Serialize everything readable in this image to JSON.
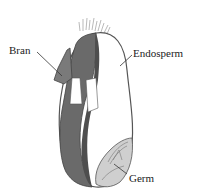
{
  "labels": {
    "bran": "Bran",
    "endosperm": "Endosperm",
    "germ": "Germ"
  },
  "colors": {
    "bran_dark": "#5a5a5a",
    "bran_mid": "#7a7a7a",
    "endosperm": "#ffffff",
    "germ": "#c8c8c8",
    "outline": "#555555",
    "leader": "#333333"
  }
}
